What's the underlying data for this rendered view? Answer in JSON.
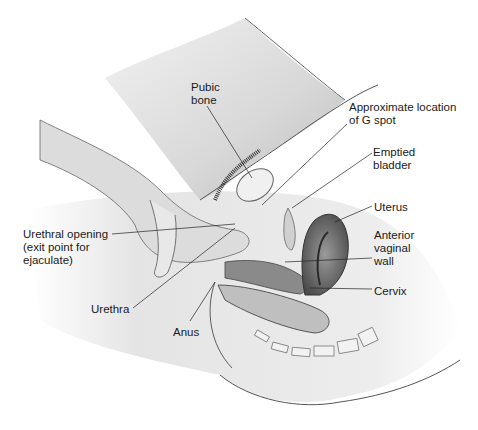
{
  "figure": {
    "type": "anatomical-diagram",
    "style": "grayscale illustration"
  },
  "labels": [
    {
      "id": "pubic-bone",
      "text": "Pubic\nbone",
      "x": 191,
      "y": 81
    },
    {
      "id": "g-spot",
      "text": "Approximate location\nof G spot",
      "x": 349,
      "y": 101
    },
    {
      "id": "emptied-bladder",
      "text": "Emptied\nbladder",
      "x": 373,
      "y": 146
    },
    {
      "id": "uterus",
      "text": "Uterus",
      "x": 374,
      "y": 201
    },
    {
      "id": "anterior-vaginal-wall",
      "text": "Anterior\nvaginal\nwall",
      "x": 374,
      "y": 229
    },
    {
      "id": "cervix",
      "text": "Cervix",
      "x": 374,
      "y": 285
    },
    {
      "id": "urethral-opening",
      "text": "Urethral opening\n(exit point for\nejaculate)",
      "x": 23,
      "y": 228
    },
    {
      "id": "urethra",
      "text": "Urethra",
      "x": 91,
      "y": 303
    },
    {
      "id": "anus",
      "text": "Anus",
      "x": 173,
      "y": 326
    }
  ]
}
